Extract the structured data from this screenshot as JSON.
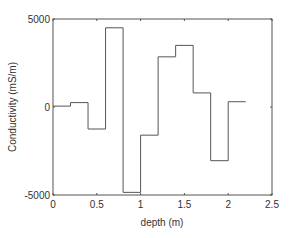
{
  "chart_data": {
    "type": "line",
    "subtype": "step",
    "title": "",
    "xlabel": "depth (m)",
    "ylabel": "Conductivity (mS/m)",
    "xlim": [
      0,
      2.5
    ],
    "ylim": [
      -5000,
      5000
    ],
    "xticks": [
      "0",
      "0.5",
      "1",
      "1.5",
      "2",
      "2.5"
    ],
    "xtick_values": [
      0,
      0.5,
      1,
      1.5,
      2,
      2.5
    ],
    "yticks": [
      "-5000",
      "0",
      "5000"
    ],
    "ytick_values": [
      -5000,
      0,
      5000
    ],
    "grid": false,
    "legend": null,
    "line_color": "#555555",
    "series": [
      {
        "name": "conductivity",
        "edges": [
          0,
          0.2,
          0.4,
          0.6,
          0.8,
          1.0,
          1.2,
          1.4,
          1.6,
          1.8,
          2.0,
          2.2
        ],
        "values": [
          50,
          250,
          -1250,
          4500,
          -4850,
          -1600,
          2850,
          3500,
          800,
          -3050,
          300
        ]
      }
    ]
  }
}
